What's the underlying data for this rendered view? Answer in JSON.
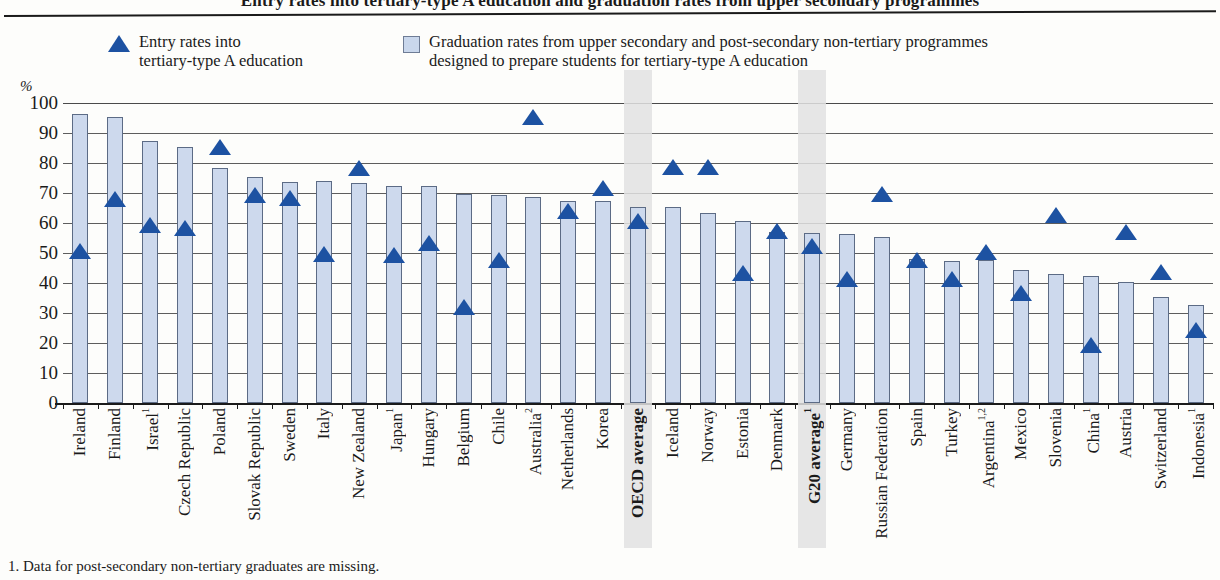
{
  "title": "Entry rates into tertiary-type A education and graduation rates from upper secondary programmes",
  "axis": {
    "unit_label": "%",
    "y_ticks": [
      "100",
      "90",
      "80",
      "70",
      "60",
      "50",
      "40",
      "30",
      "20",
      "10",
      "0"
    ]
  },
  "legend": {
    "entry": {
      "marker": "triangle-marker",
      "line1": "Entry rates into",
      "line2": "tertiary-type A education"
    },
    "graduation": {
      "marker": "square-marker",
      "line1": "Graduation rates from upper secondary and post-secondary non-tertiary programmes",
      "line2": "designed to prepare students for tertiary-type A education"
    }
  },
  "footnote": "1. Data for post-secondary non-tertiary graduates are missing.",
  "colors": {
    "bar_fill": "#cdd9ed",
    "bar_stroke": "#5c6b85",
    "marker_blue": "#1d52a2",
    "band_highlight": "#e2e2e2",
    "gridline": "#5d5d5d"
  },
  "chart_data": {
    "type": "bar",
    "title": "Entry rates into tertiary-type A education and graduation rates from upper secondary programmes",
    "xlabel": "",
    "ylabel": "%",
    "ylim": [
      0,
      100
    ],
    "ytick_step": 10,
    "grid": true,
    "legend_position": "top",
    "categories": [
      "Ireland",
      "Finland",
      "Israel",
      "Czech Republic",
      "Poland",
      "Slovak Republic",
      "Sweden",
      "Italy",
      "New Zealand",
      "Japan",
      "Hungary",
      "Belgium",
      "Chile",
      "Australia",
      "Netherlands",
      "Korea",
      "OECD average",
      "Iceland",
      "Norway",
      "Estonia",
      "Denmark",
      "G20 average",
      "Germany",
      "Russian Federation",
      "Spain",
      "Turkey",
      "Argentina",
      "Mexico",
      "Slovenia",
      "China",
      "Austria",
      "Switzerland",
      "Indonesia"
    ],
    "category_footnotes": [
      "",
      "",
      "1",
      "",
      "",
      "",
      "",
      "",
      "",
      "1",
      "",
      "",
      "",
      "2",
      "",
      "",
      "",
      "",
      "",
      "",
      "",
      "1",
      "",
      "",
      "",
      "",
      "1,2",
      "",
      "",
      "1",
      "",
      "",
      "1"
    ],
    "category_bold": [
      false,
      false,
      false,
      false,
      false,
      false,
      false,
      false,
      false,
      false,
      false,
      false,
      false,
      false,
      false,
      false,
      true,
      false,
      false,
      false,
      false,
      true,
      false,
      false,
      false,
      false,
      false,
      false,
      false,
      false,
      false,
      false,
      false
    ],
    "highlighted_categories": [
      "OECD average",
      "G20 average"
    ],
    "series": [
      {
        "name": "Graduation rates from upper secondary and post-secondary non-tertiary programmes designed to prepare students for tertiary-type A education",
        "type": "bar",
        "values": [
          96.5,
          95.5,
          87.2,
          85.5,
          78.2,
          75.5,
          73.8,
          74.0,
          73.2,
          72.3,
          72.3,
          69.8,
          69.3,
          68.8,
          67.5,
          67.2,
          65.5,
          65.5,
          63.2,
          60.8,
          57.0,
          56.8,
          56.3,
          55.3,
          48.0,
          47.2,
          47.8,
          44.3,
          43.0,
          42.3,
          40.5,
          35.3,
          32.8
        ]
      },
      {
        "name": "Entry rates into tertiary-type A education",
        "type": "scatter-triangle",
        "values": [
          50.7,
          68.0,
          59.3,
          58.5,
          85.3,
          69.2,
          68.5,
          49.8,
          78.2,
          49.5,
          53.2,
          32.0,
          47.7,
          95.3,
          64.0,
          71.8,
          60.8,
          78.7,
          78.8,
          43.5,
          57.5,
          52.5,
          41.5,
          69.8,
          47.8,
          41.5,
          50.5,
          36.8,
          62.8,
          19.5,
          57.0,
          43.8,
          24.5
        ]
      }
    ]
  }
}
